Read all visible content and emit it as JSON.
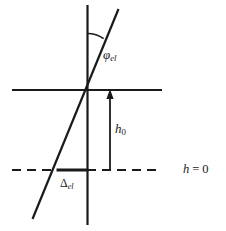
{
  "figure": {
    "name": "elevation-angle-schematic",
    "width": 226,
    "height": 231,
    "background_color": "#ffffff",
    "stroke_color": "#1a1a1a",
    "labels": {
      "phi_el": {
        "symbol": "φ",
        "subscript": "el",
        "full": "φel"
      },
      "h0": {
        "symbol": "h",
        "subscript": "0",
        "full": "h0"
      },
      "delta_el": {
        "symbol": "Δ",
        "subscript": "el",
        "full": "Δel"
      },
      "h_equals_zero": {
        "symbol": "h",
        "operator": "=",
        "value": "0",
        "full": "h = 0"
      }
    },
    "geometry": {
      "vertical_axis": {
        "x": 87.5,
        "y1": 5,
        "y2": 225,
        "stroke_width": 2.2
      },
      "horizontal_reference_line": {
        "x1": 12,
        "x2": 162,
        "y": 90,
        "stroke_width": 2.2
      },
      "dashed_zero_line": {
        "x1": 12,
        "x2": 162,
        "y": 170,
        "stroke_width": 2.0,
        "dash": "9 6"
      },
      "slanted_line": {
        "x1": 118,
        "y1": 10,
        "x2": 33,
        "y2": 219,
        "stroke_width": 2.2
      },
      "angle_arc": {
        "center_x": 87.5,
        "center_y": 5,
        "radius": 28,
        "stroke_width": 1.6
      },
      "h0_arrow": {
        "x": 110,
        "y_tail": 170,
        "y_head": 90,
        "stroke_width": 1.8
      },
      "delta_el_segment": {
        "x1": 57,
        "x2": 88,
        "y": 170,
        "stroke_width": 3.0
      }
    }
  }
}
